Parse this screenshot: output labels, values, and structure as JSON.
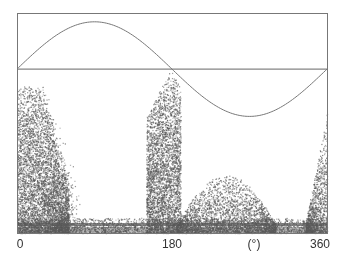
{
  "chart_data": {
    "type": "scatter",
    "title": "",
    "xlabel": "(°)",
    "ylabel": "",
    "xlim": [
      0,
      360
    ],
    "x_ticks": [
      {
        "value": 0,
        "label": "0"
      },
      {
        "value": 180,
        "label": "180"
      },
      {
        "value": 360,
        "label": "360"
      }
    ],
    "x_unit_label": {
      "position": 270,
      "label": "(°)"
    },
    "grid": false,
    "legend": null,
    "frame": {
      "left": 17,
      "top": 13,
      "right": 327,
      "bottom": 233
    },
    "reference_lines": [
      {
        "type": "horizontal",
        "y_frac": 0.255,
        "color": "#666666",
        "description": "constant horizontal line"
      },
      {
        "type": "sine",
        "description": "sinusoid, peak near 90°, trough near 270°",
        "center_frac": 0.255,
        "amplitude_frac": 0.215,
        "period": 360,
        "color": "#777777"
      }
    ],
    "density_clusters": [
      {
        "name": "left-band",
        "x_range": [
          0,
          60
        ],
        "y_top_frac": 0.33,
        "count": 5000
      },
      {
        "name": "peak-180",
        "x_range": [
          150,
          190
        ],
        "y_top_frac": 0.25,
        "count": 3500
      },
      {
        "name": "post-180-hump",
        "x_range": [
          185,
          300
        ],
        "y_top_frac": 0.75,
        "count": 2500
      },
      {
        "name": "right-edge",
        "x_range": [
          335,
          360
        ],
        "y_top_frac": 0.5,
        "count": 1000
      },
      {
        "name": "baseline",
        "x_range": [
          0,
          360
        ],
        "y_top_frac": 0.93,
        "count": 3000
      }
    ],
    "point_color": "#707070"
  }
}
